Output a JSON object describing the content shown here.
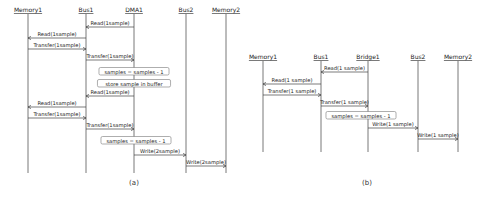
{
  "diagrams": [
    {
      "caption": "(a)",
      "participants": [
        {
          "name": "Memory1",
          "x": 28
        },
        {
          "name": "Bus1",
          "x": 86
        },
        {
          "name": "DMA1",
          "x": 134
        },
        {
          "name": "Bus2",
          "x": 186
        },
        {
          "name": "Memory2",
          "x": 226
        }
      ],
      "label_y": 12,
      "lifeline_top": 14,
      "lifeline_bottom": 173,
      "caption_pos": {
        "x": 134,
        "y": 185
      },
      "events": [
        {
          "type": "message",
          "label": "Read(1sample)",
          "from": 2,
          "to": 1,
          "y": 27
        },
        {
          "type": "message",
          "label": "Read(1sample)",
          "from": 1,
          "to": 0,
          "y": 38
        },
        {
          "type": "message",
          "label": "Transfer(1sample)",
          "from": 0,
          "to": 1,
          "y": 49
        },
        {
          "type": "message",
          "label": "Transfer(1sample)",
          "from": 1,
          "to": 2,
          "y": 60
        },
        {
          "type": "note",
          "label": "samples = samples - 1",
          "cx": 134,
          "y": 72
        },
        {
          "type": "note",
          "label": "store sample in buffer",
          "cx": 134,
          "y": 84
        },
        {
          "type": "message",
          "label": "Read(1sample)",
          "from": 2,
          "to": 1,
          "y": 96
        },
        {
          "type": "message",
          "label": "Read(1sample)",
          "from": 1,
          "to": 0,
          "y": 107
        },
        {
          "type": "message",
          "label": "Transfer(1sample)",
          "from": 0,
          "to": 1,
          "y": 118
        },
        {
          "type": "message",
          "label": "Transfer(1sample)",
          "from": 1,
          "to": 2,
          "y": 129
        },
        {
          "type": "note",
          "label": "samples = samples - 1",
          "cx": 136,
          "y": 141
        },
        {
          "type": "message",
          "label": "Write(2sample)",
          "from": 2,
          "to": 3,
          "y": 155
        },
        {
          "type": "message",
          "label": "Write(2sample)",
          "from": 3,
          "to": 4,
          "y": 166
        }
      ]
    },
    {
      "caption": "(b)",
      "participants": [
        {
          "name": "Memory1",
          "x": 263
        },
        {
          "name": "Bus1",
          "x": 321
        },
        {
          "name": "Bridge1",
          "x": 368
        },
        {
          "name": "Bus2",
          "x": 418
        },
        {
          "name": "Memory2",
          "x": 458
        }
      ],
      "label_y": 59,
      "lifeline_top": 61,
      "lifeline_bottom": 152,
      "caption_pos": {
        "x": 367,
        "y": 185
      },
      "events": [
        {
          "type": "message",
          "label": "Read(1 sample)",
          "from": 2,
          "to": 1,
          "y": 72
        },
        {
          "type": "message",
          "label": "Read(1 sample)",
          "from": 1,
          "to": 0,
          "y": 84
        },
        {
          "type": "message",
          "label": "Transfer(1 sample)",
          "from": 0,
          "to": 1,
          "y": 95
        },
        {
          "type": "message",
          "label": "Transfer(1 sample)",
          "from": 1,
          "to": 2,
          "y": 106
        },
        {
          "type": "note",
          "label": "samples = samples - 1",
          "cx": 361,
          "y": 116
        },
        {
          "type": "message",
          "label": "Write(1 sample)",
          "from": 2,
          "to": 3,
          "y": 128
        },
        {
          "type": "message",
          "label": "Write(1 sample)",
          "from": 3,
          "to": 4,
          "y": 139
        }
      ]
    }
  ]
}
